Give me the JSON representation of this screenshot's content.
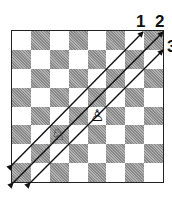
{
  "diagram": {
    "title": "",
    "board": {
      "files": 8,
      "ranks": 8,
      "top_left_color": "light"
    },
    "pieces": [
      {
        "name": "knight",
        "color": "white",
        "glyph": "♘",
        "col": 2,
        "row": 5
      },
      {
        "name": "pawn",
        "color": "white",
        "glyph": "♙",
        "col": 4,
        "row": 4
      }
    ],
    "diagonals": [
      {
        "label": "1",
        "from": [
          12,
          165
        ],
        "to": [
          143,
          32
        ]
      },
      {
        "label": "2",
        "from": [
          13,
          183
        ],
        "to": [
          163,
          32
        ]
      },
      {
        "label": "3",
        "from": [
          30,
          183
        ],
        "to": [
          163,
          50
        ]
      }
    ],
    "labels": [
      {
        "text": "1",
        "x": 136,
        "y": 13
      },
      {
        "text": "2",
        "x": 155,
        "y": 13
      },
      {
        "text": "3",
        "x": 167,
        "y": 38
      }
    ]
  }
}
